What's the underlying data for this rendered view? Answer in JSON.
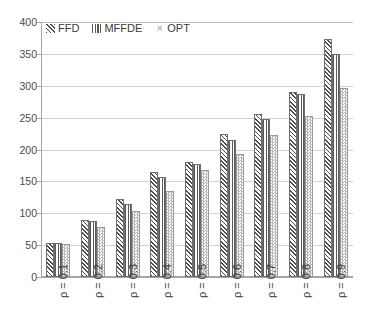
{
  "chart_data": {
    "type": "bar",
    "title": "",
    "xlabel": "",
    "ylabel": "",
    "ylim": [
      0,
      400
    ],
    "ytick_step": 50,
    "yticks": [
      "400",
      "350",
      "300",
      "250",
      "200",
      "150",
      "100",
      "50",
      "0"
    ],
    "grid": true,
    "legend_position": "top-left",
    "categories": [
      "ρ = 0.1",
      "ρ = 0.2",
      "ρ = 0.3",
      "ρ = 0.4",
      "ρ = 0.5",
      "ρ = 0.6",
      "ρ = 0.7",
      "ρ = 0.8",
      "ρ = 0.9"
    ],
    "series": [
      {
        "name": "FFD",
        "pattern": "diagonal-hatch",
        "color": "#4d4d4d",
        "values": [
          53,
          90,
          122,
          165,
          181,
          225,
          255,
          290,
          374
        ]
      },
      {
        "name": "MFFDE",
        "pattern": "vertical-lines",
        "color": "#5a5a5a",
        "values": [
          53,
          88,
          114,
          157,
          178,
          215,
          248,
          287,
          350
        ]
      },
      {
        "name": "OPT",
        "pattern": "checkerboard",
        "color": "#b9b9b9",
        "values": [
          52,
          78,
          104,
          135,
          168,
          193,
          222,
          252,
          296
        ]
      }
    ]
  },
  "legend": {
    "items": [
      {
        "label": "FFD",
        "key": "ffd"
      },
      {
        "label": "MFFDE",
        "key": "mffde"
      },
      {
        "label": "OPT",
        "key": "opt"
      }
    ]
  },
  "colors": {
    "gridline": "#d3d3d3",
    "axis": "#a6a6a6",
    "text": "#3a3a3a",
    "background": "#ffffff"
  }
}
